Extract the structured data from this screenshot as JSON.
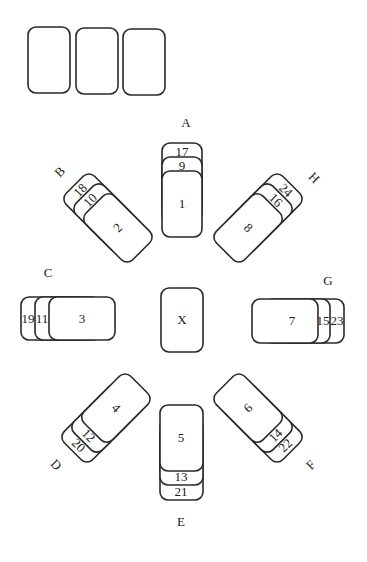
{
  "diagram": {
    "title": "",
    "top_row": {
      "cards": [
        "",
        "",
        ""
      ]
    },
    "center": {
      "label": "X"
    },
    "piles": {
      "A": {
        "label": "A",
        "cards": [
          "17",
          "9",
          "1"
        ]
      },
      "B": {
        "label": "B",
        "cards": [
          "18",
          "10",
          "2"
        ]
      },
      "C": {
        "label": "C",
        "cards": [
          "19",
          "11",
          "3"
        ]
      },
      "D": {
        "label": "D",
        "cards": [
          "20",
          "12",
          "4"
        ]
      },
      "E": {
        "label": "E",
        "cards": [
          "21",
          "13",
          "5"
        ]
      },
      "F": {
        "label": "F",
        "cards": [
          "22",
          "14",
          "6"
        ]
      },
      "G": {
        "label": "G",
        "cards": [
          "23",
          "15",
          "7"
        ]
      },
      "H": {
        "label": "H",
        "cards": [
          "24",
          "16",
          "8"
        ]
      }
    },
    "colors": {
      "stroke": "#2a2a2a",
      "fill": "#ffffff",
      "text": "#1a1a1a"
    }
  }
}
